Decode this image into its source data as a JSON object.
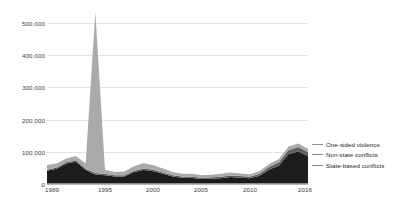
{
  "chart_data": {
    "type": "area",
    "stacked": true,
    "title": "",
    "subtitle": "",
    "xlabel": "",
    "ylabel": "",
    "xlim": [
      1989,
      2016
    ],
    "ylim": [
      0,
      500000
    ],
    "grid": true,
    "legend_position": "right",
    "x": [
      1989,
      1990,
      1991,
      1992,
      1993,
      1994,
      1995,
      1996,
      1997,
      1998,
      1999,
      2000,
      2001,
      2002,
      2003,
      2004,
      2005,
      2006,
      2007,
      2008,
      2009,
      2010,
      2011,
      2012,
      2013,
      2014,
      2015,
      2016
    ],
    "y_ticks": [
      0,
      100000,
      200000,
      300000,
      400000,
      500000
    ],
    "y_tick_labels": [
      "0",
      "100,000",
      "200,000",
      "300,000",
      "400,000",
      "500,000"
    ],
    "x_ticks": [
      1989,
      1995,
      2000,
      2005,
      2010,
      2016
    ],
    "x_tick_labels": [
      "1989",
      "1995",
      "2000",
      "2005",
      "2010",
      "2016"
    ],
    "series": [
      {
        "name": "State-based conflicts",
        "color": "#1c1c1c",
        "values": [
          40000,
          46000,
          62000,
          68000,
          42000,
          28000,
          26000,
          22000,
          22000,
          36000,
          42000,
          38000,
          30000,
          22000,
          18000,
          17000,
          14000,
          15000,
          16000,
          20000,
          18000,
          16000,
          24000,
          44000,
          56000,
          92000,
          100000,
          86000
        ]
      },
      {
        "name": "Non-state conflicts",
        "color": "#5f5f5f",
        "values": [
          3000,
          3500,
          4000,
          4500,
          4000,
          4500,
          4000,
          3500,
          3500,
          4000,
          5000,
          5000,
          4500,
          4000,
          3500,
          4000,
          4000,
          4500,
          5000,
          5000,
          5000,
          5000,
          6000,
          8000,
          10000,
          12000,
          14000,
          12000
        ]
      },
      {
        "name": "One-sided violence",
        "color": "#aaaaaa",
        "values": [
          15000,
          13000,
          12000,
          13000,
          16000,
          502000,
          13000,
          10000,
          12000,
          14000,
          16000,
          14000,
          12000,
          10000,
          9000,
          9000,
          8000,
          8000,
          9000,
          9000,
          8000,
          8000,
          9000,
          9000,
          10000,
          11000,
          11000,
          10000
        ]
      }
    ]
  },
  "legend": {
    "items": [
      {
        "label": "One-sided violence"
      },
      {
        "label": "Non-state conflicts"
      },
      {
        "label": "State-based conflicts"
      }
    ]
  }
}
